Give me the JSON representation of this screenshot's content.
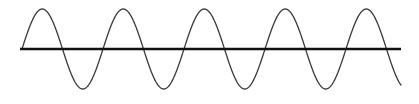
{
  "figure": {
    "background_color": "#ffffff",
    "width": 419,
    "height": 104
  },
  "chart_data": {
    "type": "line",
    "title": "",
    "subtitle": "",
    "xlabel": "",
    "ylabel": "",
    "grid": false,
    "legend": null,
    "axis": {
      "name": "horizontal-axis",
      "orientation": "horizontal",
      "y_pixel": 49,
      "x_start_pixel": 20,
      "x_end_pixel": 401,
      "color": "#111111",
      "stroke_width": 2.4
    },
    "curve": {
      "name": "sine-wave",
      "function": "y = A * sin(2*pi*(x - x0)/period)",
      "color": "#3a3a3a",
      "stroke_width": 1.3,
      "amplitude_pixels": 40,
      "period_pixels": 81,
      "phase": "starts at zero-crossing rising",
      "x_start_pixel": 22,
      "x_end_pixel": 401,
      "baseline_y_pixel": 49,
      "peak_y_pixel": 9,
      "trough_y_pixel": 89,
      "zero_crossings_x": [
        22,
        102,
        183,
        264,
        345
      ],
      "peaks_x": [
        62,
        223,
        385
      ],
      "troughs_x": [
        142,
        304
      ],
      "x": [
        22,
        32,
        42,
        52,
        62,
        72,
        82,
        92,
        102,
        112,
        122,
        132,
        142,
        152,
        162,
        172,
        183,
        193,
        203,
        213,
        223,
        233,
        243,
        253,
        264,
        274,
        284,
        294,
        304,
        314,
        324,
        334,
        345,
        355,
        365,
        375,
        385,
        395,
        401
      ],
      "y": [
        49,
        19.7,
        10.1,
        12.0,
        9.0,
        12.0,
        20.9,
        34.4,
        49.0,
        63.6,
        77.1,
        86.0,
        89.0,
        86.0,
        77.1,
        63.6,
        49.0,
        34.4,
        20.9,
        12.0,
        9.0,
        12.0,
        20.9,
        34.4,
        49.0,
        63.6,
        77.1,
        86.0,
        89.0,
        86.0,
        77.1,
        63.6,
        49.0,
        34.4,
        20.9,
        12.0,
        9.0,
        10.5,
        12.5
      ]
    },
    "ylim": [
      9,
      89
    ],
    "xlim": [
      20,
      401
    ]
  }
}
